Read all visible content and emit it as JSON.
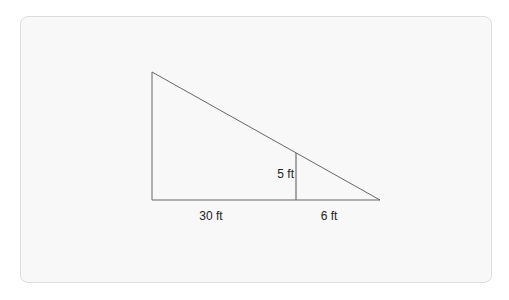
{
  "diagram": {
    "type": "similar-triangles",
    "colors": {
      "line": "#555555",
      "card_background": "#f8f8f8",
      "card_border": "#dcdcdc",
      "text": "#222222"
    },
    "labels": {
      "inner_height": "5 ft",
      "base_left": "30 ft",
      "base_right": "6 ft"
    },
    "geometry": {
      "top_left": [
        152,
        72
      ],
      "bottom_left": [
        152,
        200
      ],
      "bottom_right": [
        380,
        200
      ],
      "inner_top": [
        296,
        153
      ],
      "inner_bottom": [
        296,
        200
      ]
    }
  }
}
